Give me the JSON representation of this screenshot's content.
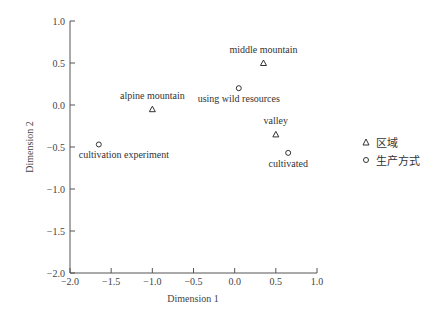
{
  "chart_data": {
    "type": "scatter",
    "title": "",
    "xlabel": "Dimension 1",
    "ylabel": "Dimension 2",
    "xlim": [
      -2.0,
      1.0
    ],
    "ylim": [
      -2.0,
      1.0
    ],
    "x_ticks": [
      "-2.0",
      "-1.5",
      "-1.0",
      "-0.5",
      "0.0",
      "0.5",
      "1.0"
    ],
    "y_ticks": [
      "1.0",
      "0.5",
      "0.0",
      "-0.5",
      "-1.0",
      "-1.5",
      "-2.0"
    ],
    "grid": false,
    "legend_position": "right",
    "series": [
      {
        "name": "区域",
        "marker": "triangle",
        "points": [
          {
            "label": "middle mountain",
            "x": 0.35,
            "y": 0.5
          },
          {
            "label": "alpine mountain",
            "x": -1.0,
            "y": -0.05
          },
          {
            "label": "valley",
            "x": 0.5,
            "y": -0.35
          }
        ]
      },
      {
        "name": "生产方式",
        "marker": "circle",
        "points": [
          {
            "label": "using wild resources",
            "x": 0.05,
            "y": 0.2
          },
          {
            "label": "cultivation experiment",
            "x": -1.65,
            "y": -0.47
          },
          {
            "label": "cultivated",
            "x": 0.65,
            "y": -0.57
          }
        ]
      }
    ]
  },
  "legend": {
    "items": [
      {
        "label": "区域",
        "marker": "triangle"
      },
      {
        "label": "生产方式",
        "marker": "circle"
      }
    ]
  }
}
